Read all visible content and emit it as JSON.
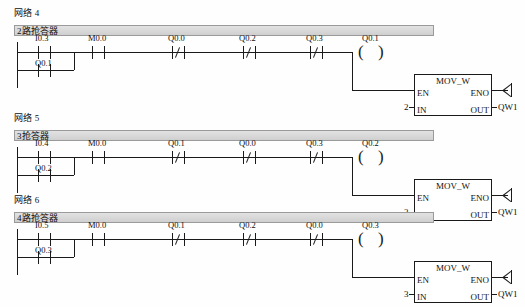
{
  "document": {
    "type": "ladder-logic-program",
    "rail_label": "left-power-rail"
  },
  "networks": [
    {
      "id": "network-4",
      "label": "网络 4",
      "title": "2路抢答器",
      "rung": {
        "branch_top": [
          {
            "name": "I0.3",
            "type": "no"
          }
        ],
        "branch_bottom": [
          {
            "name": "Q0.1",
            "type": "no"
          }
        ],
        "series": [
          {
            "name": "M0.0",
            "type": "no"
          },
          {
            "name": "Q0.0",
            "type": "nc"
          },
          {
            "name": "Q0.2",
            "type": "nc"
          },
          {
            "name": "Q0.3",
            "type": "nc"
          }
        ],
        "coil": {
          "name": "Q0.1",
          "type": "coil"
        }
      },
      "block": {
        "title": "MOV_W",
        "en": "EN",
        "eno": "ENO",
        "in": "IN",
        "out": "OUT",
        "in_value": "2",
        "out_value": "QW1"
      }
    },
    {
      "id": "network-5",
      "label": "网络 5",
      "title": "3抢答器",
      "rung": {
        "branch_top": [
          {
            "name": "I0.4",
            "type": "no"
          }
        ],
        "branch_bottom": [
          {
            "name": "Q0.2",
            "type": "no"
          }
        ],
        "series": [
          {
            "name": "M0.0",
            "type": "no"
          },
          {
            "name": "Q0.1",
            "type": "nc"
          },
          {
            "name": "Q0.0",
            "type": "nc"
          },
          {
            "name": "Q0.3",
            "type": "nc"
          }
        ],
        "coil": {
          "name": "Q0.2",
          "type": "coil"
        }
      },
      "block": {
        "title": "MOV_W",
        "en": "EN",
        "eno": "ENO",
        "in": "IN",
        "out": "OUT",
        "in_value": "2",
        "out_value": "QW1"
      }
    },
    {
      "id": "network-6",
      "label": "网络 6",
      "title": "4路抢答器",
      "rung": {
        "branch_top": [
          {
            "name": "I0.5",
            "type": "no"
          }
        ],
        "branch_bottom": [
          {
            "name": "Q0.3",
            "type": "no"
          }
        ],
        "series": [
          {
            "name": "M0.0",
            "type": "no"
          },
          {
            "name": "Q0.1",
            "type": "nc"
          },
          {
            "name": "Q0.2",
            "type": "nc"
          },
          {
            "name": "Q0.0",
            "type": "nc"
          }
        ],
        "coil": {
          "name": "Q0.3",
          "type": "coil"
        }
      },
      "block": {
        "title": "MOV_W",
        "en": "EN",
        "eno": "ENO",
        "in": "IN",
        "out": "OUT",
        "in_value": "3",
        "out_value": "QW1"
      }
    }
  ],
  "colors": {
    "wire": "#1a1a1a",
    "title_bar": "#d8d8d8",
    "title_border": "#9a9a9a",
    "background": "#ffffff"
  }
}
